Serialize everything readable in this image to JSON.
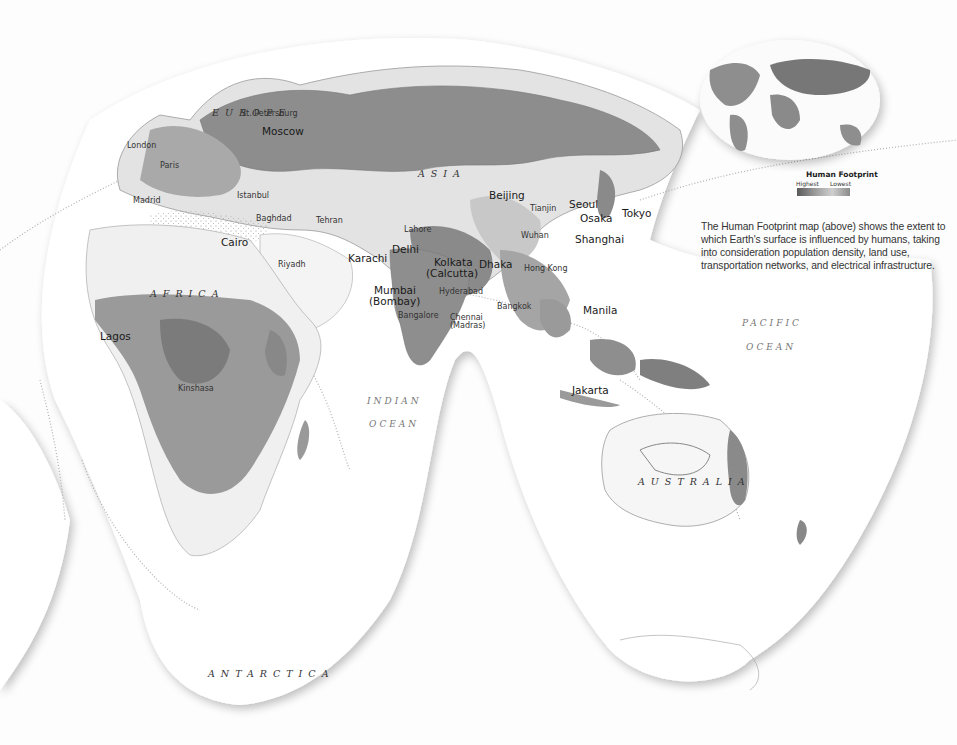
{
  "inset_map": {
    "legend_title": "Human Footprint",
    "legend_high": "Highest",
    "legend_low": "Lowest"
  },
  "caption": "The Human Footprint map (above) shows the extent to which Earth's surface is influenced by humans, taking into consideration population density, land use, transportation networks, and electrical infrastructure.",
  "regions": {
    "europe": "EUROPE",
    "asia": "ASIA",
    "africa": "AFRICA",
    "australia": "AUSTRALIA",
    "antarctica": "ANTARCTICA"
  },
  "oceans": {
    "indian_1": "INDIAN",
    "indian_2": "OCEAN",
    "pacific_1": "PACIFIC",
    "pacific_2": "OCEAN"
  },
  "cities": {
    "st_petersburg": "St. Petersburg",
    "moscow": "Moscow",
    "london": "London",
    "paris": "Paris",
    "madrid": "Madrid",
    "istanbul": "Istanbul",
    "baghdad": "Baghdad",
    "tehran": "Tehran",
    "cairo": "Cairo",
    "riyadh": "Riyadh",
    "karachi": "Karachi",
    "lahore": "Lahore",
    "delhi": "Delhi",
    "mumbai": "Mumbai",
    "mumbai_alt": "(Bombay)",
    "kolkata": "Kolkata",
    "kolkata_alt": "(Calcutta)",
    "dhaka": "Dhaka",
    "hyderabad": "Hyderabad",
    "bangalore": "Bangalore",
    "chennai": "Chennai",
    "chennai_alt": "(Madras)",
    "beijing": "Beijing",
    "tianjin": "Tianjin",
    "seoul": "Seoul",
    "osaka": "Osaka",
    "tokyo": "Tokyo",
    "wuhan": "Wuhan",
    "shanghai": "Shanghai",
    "hong_kong": "Hong Kong",
    "bangkok": "Bangkok",
    "manila": "Manila",
    "jakarta": "Jakarta",
    "lagos": "Lagos",
    "kinshasa": "Kinshasa"
  },
  "colors": {
    "ocean": "#ffffff",
    "land_light": "#e2e2e2",
    "land_mid": "#b5b5b5",
    "land_dark": "#8a8a8a",
    "land_darkest": "#6e6e6e",
    "coast": "#9a9a9a"
  }
}
